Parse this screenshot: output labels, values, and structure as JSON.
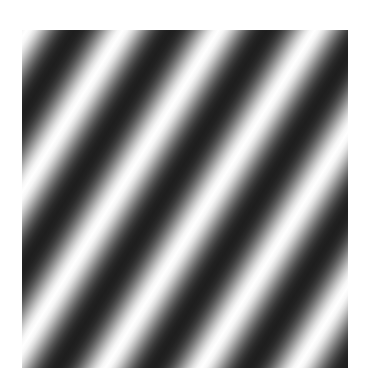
{
  "image": {
    "subject": "sinusoidal grating",
    "description": "Oblique black-and-white sinusoidal luminance grating; stripes run from lower-left to upper-right",
    "background_color": "#ffffff",
    "grating": {
      "x": 22,
      "y": 30,
      "width": 326,
      "height": 338,
      "stripe_angle_deg_from_horizontal": 58,
      "gradient_angle_deg": 31.8,
      "period_px": 81.6,
      "horizontal_period_px": 96,
      "vertical_period_px": 155,
      "cycles_across_width": 3.4,
      "cycles_across_height": 2.2,
      "light_color": "#ffffff",
      "dark_color": "#1e1e1e",
      "profile": "sinusoid"
    }
  }
}
